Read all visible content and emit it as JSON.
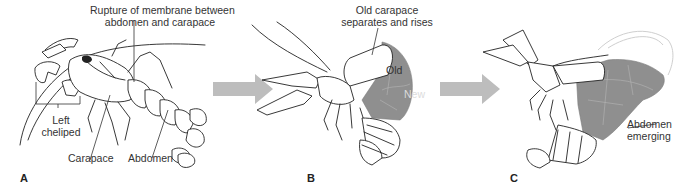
{
  "figure": {
    "arrow_color": "#bdbdbd",
    "new_exoskeleton_color": "#8f8f8f"
  },
  "panels": [
    {
      "letter": "A",
      "labels": {
        "rupture_line1": "Rupture of membrane between",
        "rupture_line2": "abdomen and carapace",
        "cheliped_line1": "Left",
        "cheliped_line2": "cheliped",
        "carapace": "Carapace",
        "abdomen": "Abdomen"
      }
    },
    {
      "letter": "B",
      "labels": {
        "separates_line1": "Old carapace",
        "separates_line2": "separates and rises",
        "old": "Old",
        "new": "New"
      }
    },
    {
      "letter": "C",
      "labels": {
        "emerging_line1": "Abdomen",
        "emerging_line2": "emerging"
      }
    }
  ]
}
